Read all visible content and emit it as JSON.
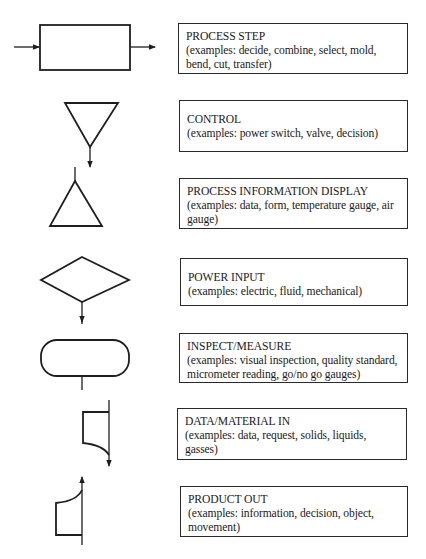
{
  "diagram": {
    "type": "flowchart-symbol-legend",
    "items": [
      {
        "symbol": "rectangle-with-in-out-arrows",
        "title": "PROCESS STEP",
        "description": "(examples: decide, combine, select, mold, bend, cut, transfer)"
      },
      {
        "symbol": "inverted-triangle-with-down-arrow",
        "title": "CONTROL",
        "description": "(examples: power switch, valve, decision)"
      },
      {
        "symbol": "upright-triangle-with-stem",
        "title": "PROCESS INFORMATION DISPLAY",
        "description": "(examples: data, form, temperature gauge, air gauge)"
      },
      {
        "symbol": "diamond-with-down-arrow",
        "title": "POWER INPUT",
        "description": "(examples: electric, fluid, mechanical)"
      },
      {
        "symbol": "rounded-rectangle-with-stem",
        "title": "INSPECT/MEASURE",
        "description": "(examples: visual inspection, quality standard, micrometer reading, go/no go gauges)"
      },
      {
        "symbol": "curved-flag-with-down-arrow",
        "title": "DATA/MATERIAL IN",
        "description": "(examples: data, request, solids, liquids, gasses)"
      },
      {
        "symbol": "curved-flag-with-up-arrow",
        "title": "PRODUCT OUT",
        "description": "(examples: information, decision, object, movement)"
      }
    ]
  },
  "colors": {
    "stroke": "#1e1e1e",
    "background": "#ffffff"
  }
}
